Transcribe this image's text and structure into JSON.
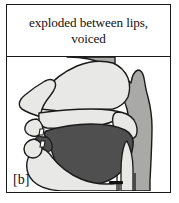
{
  "figure": {
    "caption": "exploded between lips,\nvoiced",
    "caption_line1": "exploded between lips,",
    "caption_line2": "voiced",
    "phoneme_label": "[b]",
    "diagram_type": "mid-sagittal vocal tract section",
    "articulation": {
      "place": "bilabial",
      "manner": "exploded (plosive release)",
      "voicing": "voiced"
    },
    "anatomy_parts": [
      "nasal cavity",
      "hard palate",
      "soft palate (velum)",
      "uvula",
      "pharyngeal wall",
      "tongue",
      "upper lip",
      "lower lip",
      "teeth",
      "jaw",
      "larynx",
      "vocal folds"
    ],
    "colors": {
      "outline": "#1a1a1a",
      "background": "#ffffff",
      "cavity_light": "#e8e8e6",
      "tissue_mid": "#a9a9a7",
      "tongue_dark": "#4f4f4f",
      "voicing_bar": "#111111",
      "frame": "#1a1a1a"
    }
  }
}
